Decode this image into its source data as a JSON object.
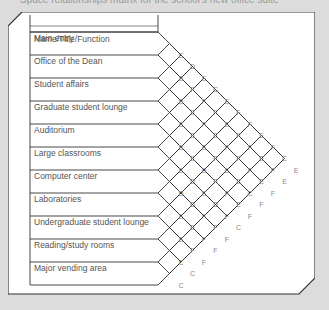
{
  "caption": "Space relationships matrix for the school's new office suite",
  "header": "Name/Title/Function",
  "items": [
    "Main entry",
    "Office of the Dean",
    "Student affairs",
    "Graduate student lounge",
    "Auditorium",
    "Large classrooms",
    "Computer center",
    "Laboratories",
    "Undergraduate student lounge",
    "Reading/study rooms",
    "Major vending area"
  ],
  "matrix": {
    "note": "Relationship codes at intersections; row = first item, col offset = distance to second item",
    "codes": [
      [
        "C",
        "D",
        "E",
        "C",
        "E",
        "F",
        "F",
        "E",
        "F",
        "C",
        "E"
      ],
      [
        "B",
        "F",
        "F",
        "F",
        "E",
        "F",
        "F",
        "E",
        "F",
        "E"
      ],
      [
        "B",
        "E",
        "F",
        "E",
        "F",
        "F",
        "F",
        "E",
        "F"
      ],
      [
        "E",
        "E",
        "E",
        "F",
        "E",
        "E",
        "C",
        "F"
      ],
      [
        "B",
        "E",
        "D",
        "F",
        "F",
        "E",
        "F"
      ],
      [
        "E",
        "D",
        "E",
        "D",
        "F",
        "C"
      ],
      [
        "D",
        "D",
        "F",
        "F",
        "F"
      ],
      [
        "E",
        "E",
        "F",
        "F"
      ],
      [
        "E",
        "F",
        "F"
      ],
      [
        "C",
        "C"
      ],
      [
        "C"
      ]
    ]
  },
  "colors": {
    "background": "#dcdcdc",
    "panel": "#ffffff",
    "line": "#333333",
    "text": "#555555",
    "code_text": "#8a8a8a"
  }
}
